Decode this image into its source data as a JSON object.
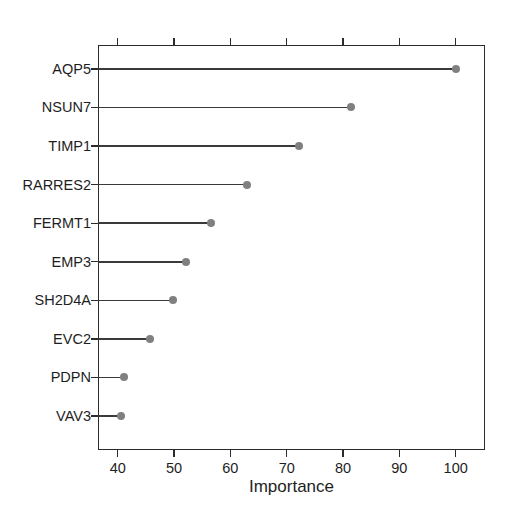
{
  "chart_data": {
    "type": "scatter",
    "subtype": "lollipop",
    "title": "",
    "xlabel": "Importance",
    "ylabel": "",
    "categories": [
      "AQP5",
      "NSUN7",
      "TIMP1",
      "RARRES2",
      "FERMT1",
      "EMP3",
      "SH2D4A",
      "EVC2",
      "PDPN",
      "VAV3"
    ],
    "values": [
      100.0,
      81.4,
      72.1,
      62.9,
      56.5,
      52.1,
      49.8,
      45.7,
      41.2,
      40.5
    ],
    "xlim": [
      36.5,
      105.2
    ],
    "xticks": [
      40,
      50,
      60,
      70,
      80,
      90,
      100
    ],
    "xtick_labels": [
      "40",
      "50",
      "60",
      "70",
      "80",
      "90",
      "100"
    ],
    "grid": false,
    "legend": null,
    "point_color": "#808080",
    "line_color": "#3a3a3a",
    "axis_color": "#2b2b2b",
    "background_color": "#ffffff",
    "orientation": "horizontal",
    "baseline": 36.5
  },
  "axis": {
    "x_title": "Importance"
  }
}
